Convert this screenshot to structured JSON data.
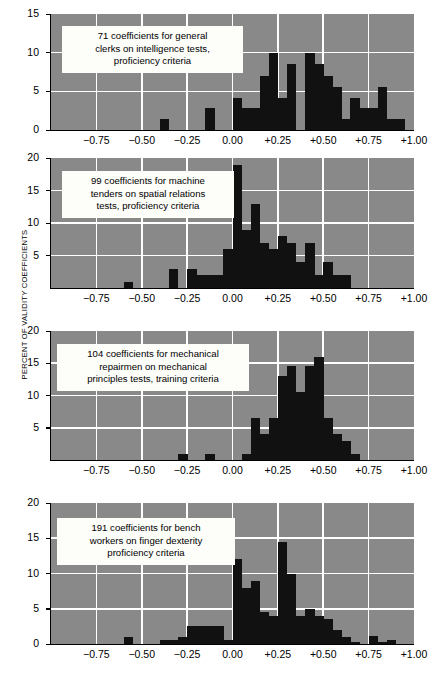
{
  "figure": {
    "ylabel": "PERCENT OF VALIDITY COEFFICIENTS"
  },
  "chart_data": [
    {
      "type": "bar",
      "panel_index": 1,
      "title": "71 coefficients for general\nclerks on intelligence tests,\nproficiency criteria",
      "xlabel": "",
      "ylabel": "PERCENT OF VALIDITY COEFFICIENTS",
      "xlim": [
        -1.0,
        1.0
      ],
      "ylim": [
        0,
        15
      ],
      "bin_width": 0.05,
      "xtick_labels": [
        "−0.75",
        "−0.50",
        "−0.25",
        "0.00",
        "+0.25",
        "+0.50",
        "+0.75",
        "+1.00"
      ],
      "xtick_values": [
        -0.75,
        -0.5,
        -0.25,
        0.0,
        0.25,
        0.5,
        0.75,
        1.0
      ],
      "ytick_labels": [
        "0",
        "5",
        "10",
        "15"
      ],
      "ytick_values": [
        0,
        5,
        10,
        15
      ],
      "grid": true,
      "bin_starts": [
        -1.0,
        -0.95,
        -0.9,
        -0.85,
        -0.8,
        -0.75,
        -0.7,
        -0.65,
        -0.6,
        -0.55,
        -0.5,
        -0.45,
        -0.4,
        -0.35,
        -0.3,
        -0.25,
        -0.2,
        -0.15,
        -0.1,
        -0.05,
        0.0,
        0.05,
        0.1,
        0.15,
        0.2,
        0.25,
        0.3,
        0.35,
        0.4,
        0.45,
        0.5,
        0.55,
        0.6,
        0.65,
        0.7,
        0.75,
        0.8,
        0.85,
        0.9,
        0.95
      ],
      "values": [
        0,
        0,
        0,
        0,
        0,
        0,
        0,
        0,
        0,
        0,
        0,
        0,
        1.4,
        0,
        0,
        0,
        0,
        2.8,
        0,
        0,
        4.2,
        2.8,
        2.8,
        7.0,
        9.9,
        4.2,
        8.5,
        0,
        9.9,
        8.5,
        7.0,
        5.6,
        1.4,
        4.2,
        2.8,
        2.8,
        5.6,
        1.4,
        1.4,
        0
      ]
    },
    {
      "type": "bar",
      "panel_index": 2,
      "title": "99 coefficients for machine\ntenders on spatial relations\ntests, proficiency criteria",
      "xlabel": "",
      "ylabel": "PERCENT OF VALIDITY COEFFICIENTS",
      "xlim": [
        -1.0,
        1.0
      ],
      "ylim": [
        0,
        20
      ],
      "bin_width": 0.05,
      "xtick_labels": [
        "−0.75",
        "−0.50",
        "−0.25",
        "0.00",
        "+0.25",
        "+0.50",
        "+0.75",
        "+1.00"
      ],
      "xtick_values": [
        -0.75,
        -0.5,
        -0.25,
        0.0,
        0.25,
        0.5,
        0.75,
        1.0
      ],
      "ytick_labels": [
        "5",
        "10",
        "15",
        "20"
      ],
      "ytick_values": [
        5,
        10,
        15,
        20
      ],
      "grid": true,
      "bin_starts": [
        -1.0,
        -0.95,
        -0.9,
        -0.85,
        -0.8,
        -0.75,
        -0.7,
        -0.65,
        -0.6,
        -0.55,
        -0.5,
        -0.45,
        -0.4,
        -0.35,
        -0.3,
        -0.25,
        -0.2,
        -0.15,
        -0.1,
        -0.05,
        0.0,
        0.05,
        0.1,
        0.15,
        0.2,
        0.25,
        0.3,
        0.35,
        0.4,
        0.45,
        0.5,
        0.55,
        0.6,
        0.65,
        0.7,
        0.75,
        0.8,
        0.85,
        0.9,
        0.95
      ],
      "values": [
        0,
        0,
        0,
        0,
        0,
        0,
        0,
        0,
        1.0,
        0,
        0,
        0,
        0,
        3.0,
        0,
        3.0,
        2.0,
        2.0,
        2.0,
        6.0,
        19.0,
        9.0,
        13.0,
        7.0,
        6.0,
        8.0,
        7.0,
        4.0,
        7.0,
        2.0,
        4.0,
        2.0,
        2.0,
        0,
        0,
        0,
        0,
        0,
        0,
        0
      ]
    },
    {
      "type": "bar",
      "panel_index": 3,
      "title": "104 coefficients for mechanical\nrepairmen on mechanical\nprinciples tests, training criteria",
      "xlabel": "",
      "ylabel": "PERCENT OF VALIDITY COEFFICIENTS",
      "xlim": [
        -1.0,
        1.0
      ],
      "ylim": [
        0,
        20
      ],
      "bin_width": 0.05,
      "xtick_labels": [
        "−0.75",
        "−0.50",
        "−0.25",
        "0.00",
        "+0.25",
        "+0.50",
        "+0.75",
        "+1.00"
      ],
      "xtick_values": [
        -0.75,
        -0.5,
        -0.25,
        0.0,
        0.25,
        0.5,
        0.75,
        1.0
      ],
      "ytick_labels": [
        "5",
        "10",
        "15",
        "20"
      ],
      "ytick_values": [
        5,
        10,
        15,
        20
      ],
      "grid": true,
      "bin_starts": [
        -1.0,
        -0.95,
        -0.9,
        -0.85,
        -0.8,
        -0.75,
        -0.7,
        -0.65,
        -0.6,
        -0.55,
        -0.5,
        -0.45,
        -0.4,
        -0.35,
        -0.3,
        -0.25,
        -0.2,
        -0.15,
        -0.1,
        -0.05,
        0.0,
        0.05,
        0.1,
        0.15,
        0.2,
        0.25,
        0.3,
        0.35,
        0.4,
        0.45,
        0.5,
        0.55,
        0.6,
        0.65,
        0.7,
        0.75,
        0.8,
        0.85,
        0.9,
        0.95
      ],
      "values": [
        0,
        0,
        0,
        0,
        0,
        0,
        0,
        0,
        0,
        0,
        0,
        0,
        0,
        0,
        1.0,
        0,
        0,
        1.0,
        0,
        0,
        0,
        1.0,
        6.5,
        4.0,
        6.5,
        13.0,
        14.5,
        10.5,
        14.5,
        16.0,
        6.5,
        4.0,
        3.0,
        1.0,
        0,
        0,
        0,
        0,
        0,
        0
      ]
    },
    {
      "type": "bar",
      "panel_index": 4,
      "title": "191 coefficients for bench\nworkers on finger dexterity\nproficiency criteria",
      "xlabel": "",
      "ylabel": "PERCENT OF VALIDITY COEFFICIENTS",
      "xlim": [
        -1.0,
        1.0
      ],
      "ylim": [
        0,
        20
      ],
      "bin_width": 0.05,
      "xtick_labels": [
        "−0.75",
        "−0.50",
        "−0.25",
        "0.00",
        "+0.25",
        "+0.50",
        "+0.75",
        "+1.00"
      ],
      "xtick_values": [
        -0.75,
        -0.5,
        -0.25,
        0.0,
        0.25,
        0.5,
        0.75,
        1.0
      ],
      "ytick_labels": [
        "0",
        "5",
        "10",
        "15",
        "20"
      ],
      "ytick_values": [
        0,
        5,
        10,
        15,
        20
      ],
      "grid": true,
      "bin_starts": [
        -1.0,
        -0.95,
        -0.9,
        -0.85,
        -0.8,
        -0.75,
        -0.7,
        -0.65,
        -0.6,
        -0.55,
        -0.5,
        -0.45,
        -0.4,
        -0.35,
        -0.3,
        -0.25,
        -0.2,
        -0.15,
        -0.1,
        -0.05,
        0.0,
        0.05,
        0.1,
        0.15,
        0.2,
        0.25,
        0.3,
        0.35,
        0.4,
        0.45,
        0.5,
        0.55,
        0.6,
        0.65,
        0.7,
        0.75,
        0.8,
        0.85,
        0.9,
        0.95
      ],
      "values": [
        0,
        0,
        0,
        0,
        0,
        0,
        0,
        0,
        1.0,
        0,
        0,
        0,
        0.5,
        0.5,
        1.0,
        2.5,
        2.5,
        2.5,
        2.5,
        0.5,
        12.0,
        8.0,
        9.0,
        4.5,
        4.0,
        14.5,
        10.0,
        4.0,
        5.0,
        4.0,
        3.5,
        2.0,
        1.0,
        0.3,
        0,
        1.2,
        0.3,
        0.5,
        0,
        0
      ]
    }
  ]
}
